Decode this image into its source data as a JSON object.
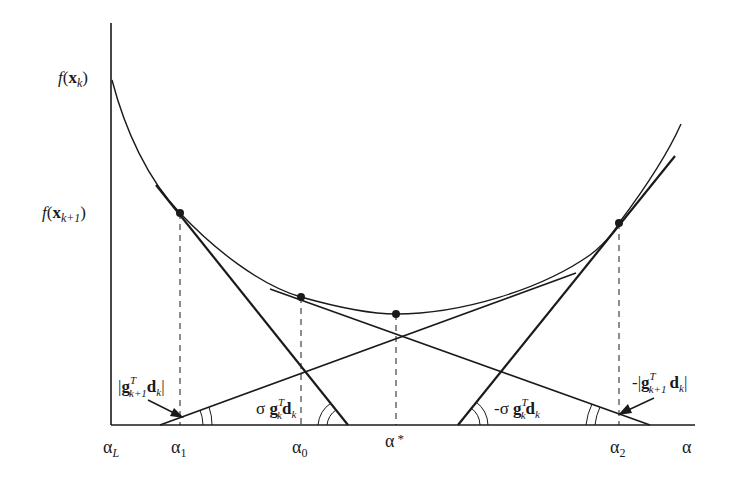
{
  "diagram": {
    "title": "",
    "y_axis_labels": {
      "f_xk": {
        "func": "f",
        "arg": "x",
        "sub": "k"
      },
      "f_xk1": {
        "func": "f",
        "arg": "x",
        "sub": "k+1"
      }
    },
    "x_axis_labels": {
      "alpha_L": {
        "sym": "α",
        "sub": "L"
      },
      "alpha_1": {
        "sym": "α",
        "sub": "1"
      },
      "alpha_0": {
        "sym": "α",
        "sub": "0"
      },
      "alpha_star": {
        "sym": "α",
        "sup": "*"
      },
      "alpha_2": {
        "sym": "α",
        "sub": "2"
      },
      "alpha": {
        "sym": "α"
      }
    },
    "annotations": {
      "abs_g_left": {
        "pre": "|",
        "g": "g",
        "sup": "T",
        "sub": "k+1",
        "d": "d",
        "dsub": "k",
        "post": "|"
      },
      "sigma_g": {
        "pre": "σ ",
        "g": "g",
        "sup": "T",
        "sub": "k",
        "d": "d",
        "dsub": "k"
      },
      "neg_sigma_g": {
        "pre": "-σ ",
        "g": "g",
        "sup": "T",
        "sub": "k",
        "d": "d",
        "dsub": "k"
      },
      "neg_abs_g_right": {
        "pre": "-|",
        "g": "g",
        "sup": "T",
        "sub": "k+1",
        "d": "d",
        "dsub": "k",
        "post": "|"
      }
    },
    "points": [
      {
        "name": "alpha_1",
        "x": 180,
        "y": 213
      },
      {
        "name": "alpha_0",
        "x": 301,
        "y": 297
      },
      {
        "name": "alpha_star",
        "x": 396,
        "y": 314
      },
      {
        "name": "alpha_2",
        "x": 619,
        "y": 223
      }
    ],
    "colors": {
      "ink": "#1a1a1a",
      "background": "#ffffff"
    }
  }
}
